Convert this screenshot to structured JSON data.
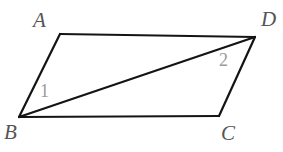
{
  "figure": {
    "background_color": "#ffffff",
    "stroke_color": "#141414",
    "stroke_width": 2.2,
    "vertex_label_color": "#555555",
    "angle_label_color": "#9a9a9a",
    "vertices": {
      "A": {
        "label": "A",
        "x": 60,
        "y": 34
      },
      "D": {
        "label": "D",
        "x": 255,
        "y": 37
      },
      "B": {
        "label": "B",
        "x": 19,
        "y": 117
      },
      "C": {
        "label": "C",
        "x": 219,
        "y": 116
      }
    },
    "edges": [
      {
        "name": "edge-AD",
        "from": "A",
        "to": "D"
      },
      {
        "name": "edge-AB",
        "from": "A",
        "to": "B"
      },
      {
        "name": "edge-BC",
        "from": "B",
        "to": "C"
      },
      {
        "name": "edge-CD",
        "from": "C",
        "to": "D"
      }
    ],
    "diagonal": {
      "name": "diagonal-BD",
      "from": "B",
      "to": "D"
    },
    "angles": [
      {
        "label": "1",
        "at_vertex": "B",
        "x": 45,
        "y": 92
      },
      {
        "label": "2",
        "at_vertex": "D",
        "x": 225,
        "y": 61
      }
    ]
  }
}
